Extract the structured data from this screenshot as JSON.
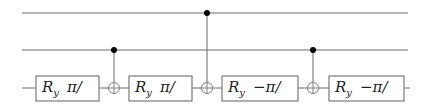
{
  "diagram": {
    "type": "quantum-circuit",
    "qubit_count": 3,
    "colors": {
      "wire": "#6a6a6a",
      "gate_border": "#7a7a7a",
      "control_dot": "#000000",
      "background": "#ffffff"
    },
    "wires": [
      {
        "index": 0,
        "y": 13,
        "x_start": 22,
        "x_end": 408
      },
      {
        "index": 1,
        "y": 50,
        "x_start": 22,
        "x_end": 408
      },
      {
        "index": 2,
        "y": 88,
        "x_start": 22,
        "x_end": 410
      }
    ],
    "gates": [
      {
        "type": "Ry",
        "wire": 2,
        "label_main": "R",
        "label_sub": "y",
        "argument": "π/",
        "x": 36,
        "width": 63
      },
      {
        "type": "CNOT",
        "control_wire": 1,
        "target_wire": 2,
        "x": 114
      },
      {
        "type": "Ry",
        "wire": 2,
        "label_main": "R",
        "label_sub": "y",
        "argument": "π/",
        "x": 129,
        "width": 63
      },
      {
        "type": "CNOT",
        "control_wire": 0,
        "target_wire": 2,
        "x": 207
      },
      {
        "type": "Ry",
        "wire": 2,
        "label_main": "R",
        "label_sub": "y",
        "argument": "−π/",
        "x": 222,
        "width": 76
      },
      {
        "type": "CNOT",
        "control_wire": 1,
        "target_wire": 2,
        "x": 313
      },
      {
        "type": "Ry",
        "wire": 2,
        "label_main": "R",
        "label_sub": "y",
        "argument": "−π/",
        "x": 329,
        "width": 75
      }
    ]
  }
}
